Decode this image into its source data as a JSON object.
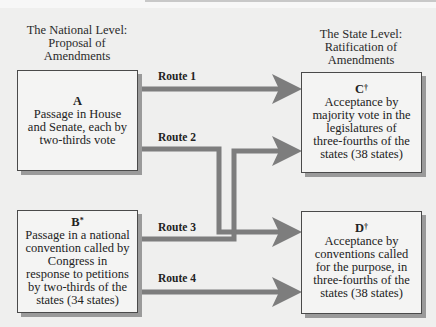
{
  "headings": {
    "national": [
      "The National Level:",
      "Proposal of",
      "Amendments"
    ],
    "state": [
      "The State Level:",
      "Ratification of",
      "Amendments"
    ]
  },
  "boxes": {
    "A": {
      "letter": "A",
      "mark": "",
      "lines": [
        "Passage in House",
        "and Senate, each by",
        "two-thirds vote"
      ]
    },
    "B": {
      "letter": "B",
      "mark": "*",
      "lines": [
        "Passage in a national",
        "convention called by",
        "Congress in",
        "response to petitions",
        "by two-thirds of the",
        "states (34 states)"
      ]
    },
    "C": {
      "letter": "C",
      "mark": "†",
      "lines": [
        "Acceptance by",
        "majority vote in the",
        "legislatures of",
        "three-fourths of the",
        "states (38 states)"
      ]
    },
    "D": {
      "letter": "D",
      "mark": "†",
      "lines": [
        "Acceptance by",
        "conventions called",
        "for the purpose, in",
        "three-fourths of the",
        "states (38 states)"
      ]
    }
  },
  "routes": [
    {
      "label": "Route 1",
      "from": "A",
      "to": "C"
    },
    {
      "label": "Route 2",
      "from": "A",
      "to": "D"
    },
    {
      "label": "Route 3",
      "from": "B",
      "to": "C"
    },
    {
      "label": "Route 4",
      "from": "B",
      "to": "D"
    }
  ],
  "colors": {
    "line": "#7d7d7d",
    "box_border": "#4a4a4a",
    "shadow": "#9a9a9a",
    "background": "#efefee"
  }
}
